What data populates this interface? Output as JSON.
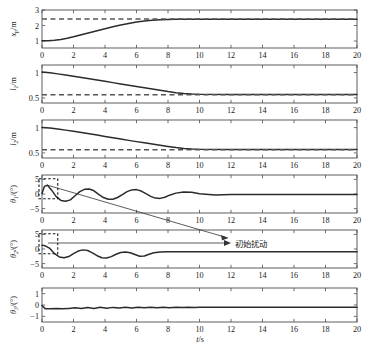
{
  "figure": {
    "xlabel": "t/s",
    "caption": "",
    "annotation": "初始扰动",
    "line_color": "#2b2b2b",
    "ref_color": "#555555",
    "axis_color": "#4d4d4d"
  },
  "chart_data": [
    {
      "type": "line",
      "title": "",
      "xlabel": "t/s",
      "ylabel": "x_p/m",
      "ylabel_main": "x",
      "ylabel_sub": "p",
      "ylabel_unit": "/m",
      "xlim": [
        0,
        20
      ],
      "ylim": [
        0.55,
        3.0
      ],
      "xticks": [
        0,
        2,
        4,
        6,
        8,
        10,
        12,
        14,
        16,
        18,
        20
      ],
      "yticks": [
        1,
        2,
        3
      ],
      "ytick_labels": [
        "1",
        "2",
        "3"
      ],
      "grid": false,
      "legend": "none",
      "series": [
        {
          "name": "x_p response",
          "style": "solid",
          "x": [
            0,
            0.4,
            0.8,
            1.2,
            1.6,
            2.0,
            2.5,
            3.0,
            3.5,
            4.0,
            4.5,
            5.0,
            5.5,
            6.0,
            6.5,
            7.0,
            7.5,
            8.0,
            8.5,
            9.0,
            9.5,
            10,
            12,
            14,
            16,
            18,
            20
          ],
          "values": [
            1.02,
            1.02,
            1.05,
            1.1,
            1.18,
            1.27,
            1.4,
            1.53,
            1.66,
            1.79,
            1.92,
            2.03,
            2.13,
            2.22,
            2.29,
            2.34,
            2.37,
            2.39,
            2.4,
            2.4,
            2.4,
            2.4,
            2.4,
            2.4,
            2.4,
            2.4,
            2.4
          ]
        },
        {
          "name": "x_p reference",
          "style": "dashed",
          "x": [
            0,
            20
          ],
          "values": [
            2.42,
            2.42
          ]
        }
      ]
    },
    {
      "type": "line",
      "title": "",
      "xlabel": "t/s",
      "ylabel": "l_1/m",
      "ylabel_main": "l",
      "ylabel_sub": "1",
      "ylabel_unit": "/m",
      "xlim": [
        0,
        20
      ],
      "ylim": [
        0.4,
        1.15
      ],
      "xticks": [
        0,
        2,
        4,
        6,
        8,
        10,
        12,
        14,
        16,
        18,
        20
      ],
      "yticks": [
        0.5,
        1
      ],
      "ytick_labels": [
        "0.5",
        "1"
      ],
      "grid": false,
      "legend": "none",
      "series": [
        {
          "name": "l_1 response",
          "style": "solid",
          "x": [
            0,
            0.5,
            1.0,
            1.5,
            2.0,
            2.5,
            3.0,
            3.5,
            4.0,
            4.5,
            5.0,
            5.5,
            6.0,
            6.5,
            7.0,
            7.5,
            8.0,
            8.5,
            9.0,
            9.5,
            10,
            12,
            14,
            16,
            18,
            20
          ],
          "values": [
            1.01,
            0.995,
            0.975,
            0.953,
            0.93,
            0.905,
            0.88,
            0.855,
            0.828,
            0.802,
            0.776,
            0.75,
            0.724,
            0.7,
            0.676,
            0.65,
            0.625,
            0.604,
            0.588,
            0.578,
            0.573,
            0.57,
            0.57,
            0.57,
            0.57,
            0.57
          ]
        },
        {
          "name": "l_1 reference",
          "style": "dashed",
          "x": [
            0,
            20
          ],
          "values": [
            0.565,
            0.565
          ]
        }
      ]
    },
    {
      "type": "line",
      "title": "",
      "xlabel": "t/s",
      "ylabel": "l_2/m",
      "ylabel_main": "l",
      "ylabel_sub": "2",
      "ylabel_unit": "/m",
      "xlim": [
        0,
        20
      ],
      "ylim": [
        0.4,
        1.15
      ],
      "xticks": [
        0,
        2,
        4,
        6,
        8,
        10,
        12,
        14,
        16,
        18,
        20
      ],
      "yticks": [
        0.5,
        1
      ],
      "ytick_labels": [
        "0.5",
        "1"
      ],
      "grid": false,
      "legend": "none",
      "series": [
        {
          "name": "l_2 response",
          "style": "solid",
          "x": [
            0,
            0.5,
            1.0,
            1.5,
            2.0,
            2.5,
            3.0,
            3.5,
            4.0,
            4.5,
            5.0,
            5.5,
            6.0,
            6.5,
            7.0,
            7.5,
            8.0,
            8.5,
            9.0,
            9.5,
            10,
            12,
            14,
            16,
            18,
            20
          ],
          "values": [
            1.0,
            0.99,
            0.972,
            0.95,
            0.927,
            0.903,
            0.878,
            0.852,
            0.826,
            0.8,
            0.774,
            0.748,
            0.723,
            0.699,
            0.675,
            0.65,
            0.626,
            0.605,
            0.589,
            0.579,
            0.574,
            0.57,
            0.57,
            0.57,
            0.57,
            0.57
          ]
        },
        {
          "name": "l_2 reference",
          "style": "dashed",
          "x": [
            0,
            20
          ],
          "values": [
            0.565,
            0.565
          ]
        }
      ]
    },
    {
      "type": "line",
      "title": "",
      "xlabel": "t/s",
      "ylabel": "θ_1/(°)",
      "ylabel_main": "θ",
      "ylabel_sub": "1",
      "ylabel_unit": "/(°)",
      "xlim": [
        0,
        20
      ],
      "ylim": [
        -6.5,
        6.5
      ],
      "xticks": [
        0,
        2,
        4,
        6,
        8,
        10,
        12,
        14,
        16,
        18,
        20
      ],
      "yticks": [
        -5,
        0,
        5
      ],
      "ytick_labels": [
        "−5",
        "0",
        "5"
      ],
      "grid": false,
      "legend": "none",
      "annotation_box": {
        "x0": 0.0,
        "x1": 1.0,
        "y0": -1.6,
        "y1": 5.2
      },
      "series": [
        {
          "name": "θ_1 response",
          "style": "solid",
          "x": [
            0,
            0.15,
            0.35,
            0.6,
            0.9,
            1.2,
            1.5,
            1.8,
            2.1,
            2.4,
            2.7,
            3.0,
            3.3,
            3.6,
            3.9,
            4.2,
            4.5,
            4.8,
            5.1,
            5.4,
            5.7,
            6.0,
            6.3,
            6.6,
            6.9,
            7.2,
            7.5,
            7.8,
            8.1,
            8.5,
            9,
            9.5,
            10,
            11,
            12,
            14,
            16,
            18,
            20
          ],
          "values": [
            0.2,
            2.6,
            3.0,
            1.4,
            -0.9,
            -2.2,
            -2.5,
            -2.0,
            -0.6,
            0.8,
            1.6,
            1.7,
            1.1,
            -0.1,
            -1.2,
            -1.8,
            -1.8,
            -1.2,
            -0.2,
            0.8,
            1.4,
            1.5,
            1.0,
            0.1,
            -0.8,
            -1.4,
            -1.5,
            -1.1,
            -0.4,
            0.3,
            0.7,
            0.6,
            0.1,
            -0.3,
            -0.2,
            -0.2,
            -0.2,
            -0.2,
            -0.2
          ]
        }
      ]
    },
    {
      "type": "line",
      "title": "",
      "xlabel": "t/s",
      "ylabel": "θ_2/(°)",
      "ylabel_main": "θ",
      "ylabel_sub": "2",
      "ylabel_unit": "/(°)",
      "xlim": [
        0,
        20
      ],
      "ylim": [
        -6.5,
        6.5
      ],
      "xticks": [
        0,
        2,
        4,
        6,
        8,
        10,
        12,
        14,
        16,
        18,
        20
      ],
      "yticks": [
        -5,
        0,
        5
      ],
      "ytick_labels": [
        "−5",
        "0",
        "5"
      ],
      "grid": false,
      "legend": "none",
      "annotation_box": {
        "x0": 0.0,
        "x1": 1.0,
        "y0": -1.6,
        "y1": 5.2
      },
      "series": [
        {
          "name": "θ_2 response",
          "style": "solid",
          "x": [
            0,
            0.2,
            0.5,
            0.8,
            1.1,
            1.4,
            1.7,
            2.0,
            2.3,
            2.6,
            2.9,
            3.2,
            3.5,
            3.8,
            4.1,
            4.4,
            4.7,
            5.0,
            5.3,
            5.6,
            5.9,
            6.2,
            6.5,
            6.8,
            7.1,
            7.5,
            8,
            8.5,
            9,
            9.5,
            10,
            12,
            14,
            16,
            18,
            20
          ],
          "values": [
            1.3,
            1.1,
            0.2,
            -1.6,
            -2.7,
            -3.0,
            -2.6,
            -1.6,
            -0.7,
            -0.3,
            -0.5,
            -1.3,
            -2.3,
            -3.0,
            -3.1,
            -2.6,
            -1.8,
            -1.2,
            -1.0,
            -1.3,
            -1.9,
            -2.5,
            -2.4,
            -1.8,
            -1.3,
            -1.0,
            -0.9,
            -0.9,
            -0.9,
            -0.9,
            -0.9,
            -0.9,
            -0.9,
            -0.9,
            -0.9,
            -0.9
          ]
        }
      ]
    },
    {
      "type": "line",
      "title": "",
      "xlabel": "t/s",
      "ylabel": "θ_3/(°)",
      "ylabel_main": "θ",
      "ylabel_sub": "3",
      "ylabel_unit": "/(°)",
      "xlim": [
        0,
        20
      ],
      "ylim": [
        -1.5,
        1.5
      ],
      "xticks": [
        0,
        2,
        4,
        6,
        8,
        10,
        12,
        14,
        16,
        18,
        20
      ],
      "yticks": [
        -1,
        0,
        1
      ],
      "ytick_labels": [
        "−1",
        "0",
        "1"
      ],
      "grid": false,
      "legend": "none",
      "series": [
        {
          "name": "θ_3 response",
          "style": "solid",
          "x": [
            0,
            0.2,
            0.5,
            0.9,
            1.3,
            1.7,
            2.1,
            2.5,
            2.9,
            3.3,
            3.7,
            4.1,
            4.5,
            4.9,
            5.3,
            5.7,
            6.1,
            6.5,
            6.9,
            7.3,
            7.7,
            8.1,
            8.5,
            8.9,
            9.3,
            9.7,
            10,
            11,
            12,
            14,
            16,
            18,
            20
          ],
          "values": [
            -0.05,
            -0.32,
            -0.34,
            -0.3,
            -0.34,
            -0.3,
            -0.25,
            -0.3,
            -0.22,
            -0.3,
            -0.2,
            -0.28,
            -0.21,
            -0.27,
            -0.2,
            -0.26,
            -0.2,
            -0.25,
            -0.2,
            -0.24,
            -0.2,
            -0.24,
            -0.19,
            -0.22,
            -0.2,
            -0.21,
            -0.2,
            -0.2,
            -0.2,
            -0.2,
            -0.2,
            -0.2,
            -0.2
          ]
        }
      ]
    }
  ]
}
